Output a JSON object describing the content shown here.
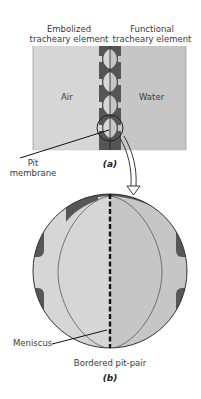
{
  "panel_a": {
    "caption": "(a)",
    "left_header": [
      "Embolized",
      "tracheary element"
    ],
    "right_header": [
      "Functional",
      "tracheary element"
    ],
    "left_region_label": "Air",
    "right_region_label": "Water",
    "callout_label": [
      "Pit",
      "membrane"
    ],
    "colors": {
      "air": "#d6d6d6",
      "water": "#c6c6c6",
      "wall": "#555555"
    }
  },
  "panel_b": {
    "caption": "(b)",
    "structure_label": "Bordered pit-pair",
    "callout_label": "Meniscus",
    "colors": {
      "air": "#d6d6d6",
      "water": "#c6c6c6",
      "wall": "#575757",
      "membrane": "#111111"
    }
  }
}
